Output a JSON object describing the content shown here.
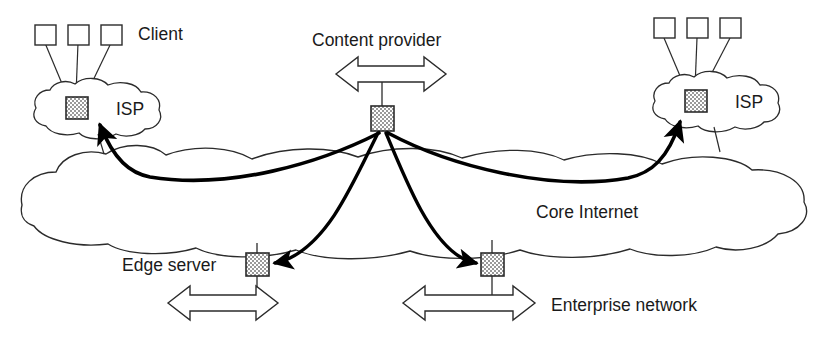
{
  "diagram": {
    "colors": {
      "stroke": "#2b2b2b",
      "thick_arrow": "#000000",
      "node_fill": "#b4b4b4",
      "background": "#ffffff",
      "text": "#1a1a1a"
    },
    "labels": {
      "client": "Client",
      "isp_left": "ISP",
      "isp_right": "ISP",
      "content_provider": "Content provider",
      "core_internet": "Core Internet",
      "edge_server": "Edge server",
      "enterprise_network": "Enterprise network"
    },
    "nodes": [
      {
        "id": "isp-left-server",
        "name": "isp-left-server-node",
        "kind": "hatched-server",
        "x": 66,
        "y": 97
      },
      {
        "id": "isp-right-server",
        "name": "isp-right-server-node",
        "kind": "hatched-server",
        "x": 685,
        "y": 90
      },
      {
        "id": "content-provider",
        "name": "content-provider-node",
        "kind": "hatched-server",
        "x": 371,
        "y": 106
      },
      {
        "id": "edge-server",
        "name": "edge-server-node",
        "kind": "hatched-server",
        "x": 246,
        "y": 253
      },
      {
        "id": "enterprise-node",
        "name": "enterprise-network-node",
        "kind": "hatched-server",
        "x": 481,
        "y": 253
      }
    ],
    "clouds": [
      {
        "id": "isp-left",
        "name": "isp-left-cloud",
        "label": "ISP"
      },
      {
        "id": "isp-right",
        "name": "isp-right-cloud",
        "label": "ISP"
      },
      {
        "id": "core",
        "name": "core-internet-cloud",
        "label": "Core Internet"
      }
    ],
    "client_groups": [
      {
        "side": "left",
        "count": 3,
        "label": "Client"
      },
      {
        "side": "right",
        "count": 3,
        "label": ""
      }
    ],
    "delivery_arrows": [
      {
        "from": "content-provider",
        "to": "isp-left-server",
        "name": "delivery-arrow-to-isp-left"
      },
      {
        "from": "content-provider",
        "to": "isp-right-server",
        "name": "delivery-arrow-to-isp-right"
      },
      {
        "from": "content-provider",
        "to": "edge-server",
        "name": "delivery-arrow-to-edge-server"
      },
      {
        "from": "content-provider",
        "to": "enterprise-node",
        "name": "delivery-arrow-to-enterprise"
      }
    ],
    "bidirectional_arrows": [
      {
        "id": "content-provider-link",
        "name": "content-provider-bidirectional-arrow"
      },
      {
        "id": "edge-server-link",
        "name": "edge-server-bidirectional-arrow"
      },
      {
        "id": "enterprise-link",
        "name": "enterprise-bidirectional-arrow"
      }
    ]
  }
}
